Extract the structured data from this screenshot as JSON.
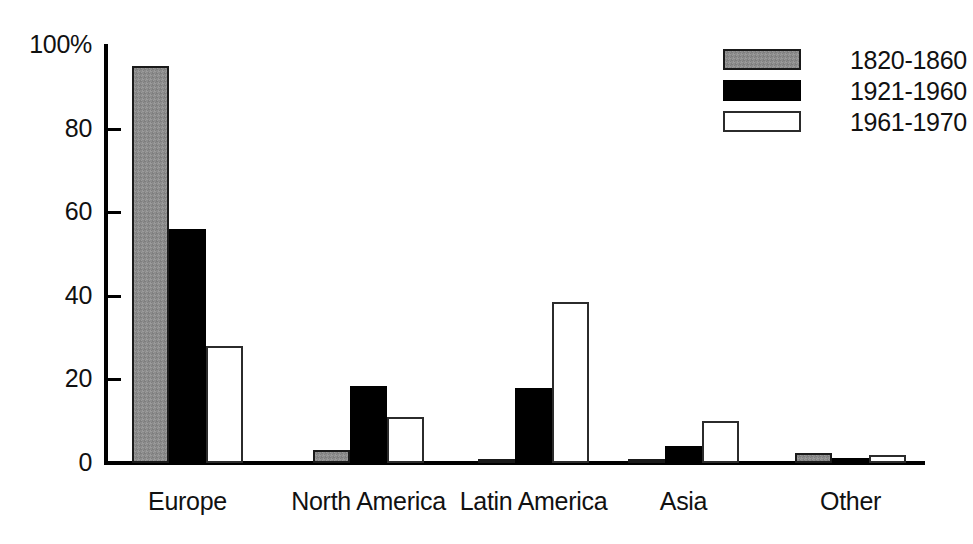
{
  "chart_data": {
    "type": "bar",
    "title": "",
    "xlabel": "",
    "ylabel": "",
    "categories": [
      "Europe",
      "North America",
      "Latin America",
      "Asia",
      "Other"
    ],
    "series": [
      {
        "name": "1820-1860",
        "color": "#8c8c8c",
        "values": [
          95,
          3,
          0.7,
          0.8,
          2.5
        ]
      },
      {
        "name": "1921-1960",
        "color": "#000000",
        "values": [
          56,
          18.5,
          18,
          4,
          1.3
        ]
      },
      {
        "name": "1961-1970",
        "color": "#ffffff",
        "values": [
          28,
          11,
          38.5,
          10,
          2
        ]
      }
    ],
    "ylim": [
      0,
      100
    ],
    "yticks": [
      0,
      20,
      40,
      60,
      80,
      100
    ],
    "ytick_labels": [
      "0",
      "20",
      "40",
      "60",
      "80",
      "100%"
    ],
    "grid": false,
    "legend_position": "top-right"
  },
  "axis": {
    "y_labels": [
      "100%",
      "80",
      "60",
      "40",
      "20",
      "0"
    ]
  },
  "legend": {
    "entries": [
      {
        "label": "1820-1860"
      },
      {
        "label": "1921-1960"
      },
      {
        "label": "1961-1970"
      }
    ]
  }
}
